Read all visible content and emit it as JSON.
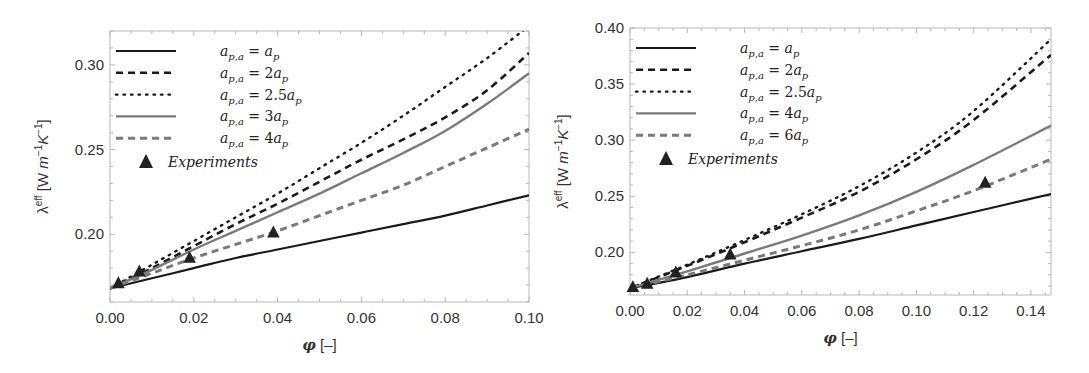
{
  "chart_data": [
    {
      "type": "line",
      "panel": "left",
      "title": "",
      "xlabel": "φ [–]",
      "ylabel": "λ^eff [W m^-1 K^-1]",
      "xlim": [
        0.0,
        0.1
      ],
      "ylim": [
        0.16,
        0.32
      ],
      "xticks": [
        0.0,
        0.02,
        0.04,
        0.06,
        0.08,
        0.1
      ],
      "xtick_labels": [
        "0.00",
        "0.02",
        "0.04",
        "0.06",
        "0.08",
        "0.10"
      ],
      "yticks": [
        0.2,
        0.25,
        0.3
      ],
      "ytick_labels": [
        "0.20",
        "0.25",
        "0.30"
      ],
      "grid": false,
      "legend_position": "upper left",
      "x": [
        0.0,
        0.01,
        0.02,
        0.03,
        0.04,
        0.05,
        0.06,
        0.07,
        0.08,
        0.09,
        0.1
      ],
      "series": [
        {
          "name": "a_p,a = a_p",
          "style": "solid-black",
          "values": [
            0.168,
            0.174,
            0.18,
            0.186,
            0.191,
            0.196,
            0.201,
            0.206,
            0.211,
            0.217,
            0.223
          ]
        },
        {
          "name": "a_p,a = 2a_p",
          "style": "dashed-black",
          "values": [
            0.168,
            0.18,
            0.193,
            0.206,
            0.218,
            0.231,
            0.244,
            0.256,
            0.269,
            0.285,
            0.307
          ]
        },
        {
          "name": "a_p,a = 2.5a_p",
          "style": "dotted-black",
          "values": [
            0.168,
            0.182,
            0.196,
            0.21,
            0.224,
            0.239,
            0.254,
            0.27,
            0.287,
            0.304,
            0.323
          ]
        },
        {
          "name": "a_p,a = 3a_p",
          "style": "solid-gray",
          "values": [
            0.168,
            0.179,
            0.191,
            0.202,
            0.213,
            0.224,
            0.236,
            0.248,
            0.261,
            0.277,
            0.295
          ]
        },
        {
          "name": "a_p,a = 4a_p",
          "style": "dashed-gray",
          "values": [
            0.168,
            0.177,
            0.186,
            0.194,
            0.202,
            0.211,
            0.22,
            0.229,
            0.24,
            0.251,
            0.262
          ]
        }
      ],
      "experiments": {
        "name": "Experiments",
        "x": [
          0.002,
          0.007,
          0.019,
          0.039
        ],
        "y": [
          0.171,
          0.178,
          0.186,
          0.201
        ]
      }
    },
    {
      "type": "line",
      "panel": "right",
      "title": "",
      "xlabel": "φ [–]",
      "ylabel": "λ^eff [W m^-1 K^-1]",
      "xlim": [
        0.0,
        0.147
      ],
      "ylim": [
        0.162,
        0.4
      ],
      "xticks": [
        0.0,
        0.02,
        0.04,
        0.06,
        0.08,
        0.1,
        0.12,
        0.14
      ],
      "xtick_labels": [
        "0.00",
        "0.02",
        "0.04",
        "0.06",
        "0.08",
        "0.10",
        "0.12",
        "0.14"
      ],
      "yticks": [
        0.2,
        0.25,
        0.3,
        0.35,
        0.4
      ],
      "ytick_labels": [
        "0.20",
        "0.25",
        "0.30",
        "0.35",
        "0.40"
      ],
      "grid": false,
      "legend_position": "upper left",
      "x": [
        0.0,
        0.02,
        0.04,
        0.06,
        0.08,
        0.1,
        0.12,
        0.147
      ],
      "series": [
        {
          "name": "a_p,a = a_p",
          "style": "solid-black",
          "values": [
            0.168,
            0.178,
            0.19,
            0.201,
            0.212,
            0.224,
            0.236,
            0.252
          ]
        },
        {
          "name": "a_p,a = 2a_p",
          "style": "dashed-black",
          "values": [
            0.168,
            0.188,
            0.209,
            0.231,
            0.254,
            0.283,
            0.318,
            0.376
          ]
        },
        {
          "name": "a_p,a = 2.5a_p",
          "style": "dotted-black",
          "values": [
            0.168,
            0.189,
            0.211,
            0.234,
            0.259,
            0.289,
            0.326,
            0.39
          ]
        },
        {
          "name": "a_p,a = 4a_p",
          "style": "solid-gray",
          "values": [
            0.168,
            0.183,
            0.199,
            0.215,
            0.233,
            0.254,
            0.278,
            0.313
          ]
        },
        {
          "name": "a_p,a = 6a_p",
          "style": "dashed-gray",
          "values": [
            0.168,
            0.18,
            0.193,
            0.206,
            0.22,
            0.237,
            0.255,
            0.283
          ]
        }
      ],
      "experiments": {
        "name": "Experiments",
        "x": [
          0.001,
          0.006,
          0.016,
          0.035,
          0.124
        ],
        "y": [
          0.169,
          0.172,
          0.182,
          0.198,
          0.262
        ]
      }
    }
  ],
  "legend_left": [
    {
      "lhs": "a",
      "sub": "p,a",
      "rhs": "a",
      "coef": "",
      "rsub": "p"
    },
    {
      "lhs": "a",
      "sub": "p,a",
      "rhs": "a",
      "coef": "2",
      "rsub": "p"
    },
    {
      "lhs": "a",
      "sub": "p,a",
      "rhs": "a",
      "coef": "2.5",
      "rsub": "p"
    },
    {
      "lhs": "a",
      "sub": "p,a",
      "rhs": "a",
      "coef": "3",
      "rsub": "p"
    },
    {
      "lhs": "a",
      "sub": "p,a",
      "rhs": "a",
      "coef": "4",
      "rsub": "p"
    }
  ],
  "legend_right": [
    {
      "lhs": "a",
      "sub": "p,a",
      "rhs": "a",
      "coef": "",
      "rsub": "p"
    },
    {
      "lhs": "a",
      "sub": "p,a",
      "rhs": "a",
      "coef": "2",
      "rsub": "p"
    },
    {
      "lhs": "a",
      "sub": "p,a",
      "rhs": "a",
      "coef": "2.5",
      "rsub": "p"
    },
    {
      "lhs": "a",
      "sub": "p,a",
      "rhs": "a",
      "coef": "4",
      "rsub": "p"
    },
    {
      "lhs": "a",
      "sub": "p,a",
      "rhs": "a",
      "coef": "6",
      "rsub": "p"
    }
  ],
  "legend_experiments": "Experiments",
  "axis_labels": {
    "x": "φ [–]",
    "y_main": "λ",
    "y_sup": "eff",
    "y_units": " [W m",
    "y_m_sup": "−1",
    "y_K": "K",
    "y_K_sup": "−1",
    "y_close": "]"
  },
  "colors": {
    "black": "#1a1a1a",
    "gray": "#7a7a7a",
    "frame": "#b8b8b8",
    "marker": "#222222"
  },
  "panels": {
    "left": {
      "x0": 110,
      "x1": 529,
      "y0": 31,
      "y1": 302
    },
    "right": {
      "x0": 630,
      "x1": 1051,
      "y0": 28,
      "y1": 295
    }
  }
}
